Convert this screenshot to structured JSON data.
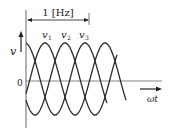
{
  "diagram": {
    "type": "three-phase-sine-waveform",
    "frequency_bracket_label": "1 [Hz]",
    "y_axis_label": "v",
    "x_axis_label": "ωt",
    "origin_label": "0",
    "waves": [
      {
        "label": "v1",
        "main": "v",
        "sub": "1",
        "phase_deg": 0
      },
      {
        "label": "v2",
        "main": "v",
        "sub": "2",
        "phase_deg": 120
      },
      {
        "label": "v3",
        "main": "v",
        "sub": "3",
        "phase_deg": 240
      }
    ],
    "colors": {
      "stroke": "#2a2a2a",
      "axis": "#555555",
      "background": "#ffffff"
    }
  }
}
